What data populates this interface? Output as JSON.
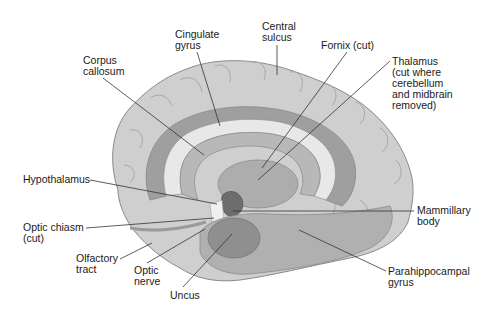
{
  "diagram": {
    "labels": [
      {
        "id": "cingulate-gyrus",
        "lines": [
          "Cingulate",
          "gyrus"
        ],
        "x": 175,
        "y": 29
      },
      {
        "id": "central-sulcus",
        "lines": [
          "Central",
          "sulcus"
        ],
        "x": 262,
        "y": 21
      },
      {
        "id": "fornix",
        "lines": [
          "Fornix (cut)"
        ],
        "x": 321,
        "y": 40
      },
      {
        "id": "corpus-callosum",
        "lines": [
          "Corpus",
          "callosum"
        ],
        "x": 83,
        "y": 55
      },
      {
        "id": "thalamus",
        "lines": [
          "Thalamus",
          "(cut where",
          "cerebellum",
          "and midbrain",
          "removed)"
        ],
        "x": 392,
        "y": 56
      },
      {
        "id": "hypothalamus",
        "lines": [
          "Hypothalamus"
        ],
        "x": 23,
        "y": 174
      },
      {
        "id": "optic-chiasm",
        "lines": [
          "Optic chiasm",
          "(cut)"
        ],
        "x": 23,
        "y": 222
      },
      {
        "id": "mammillary-body",
        "lines": [
          "Mammillary",
          "body"
        ],
        "x": 417,
        "y": 205
      },
      {
        "id": "olfactory-tract",
        "lines": [
          "Olfactory",
          "tract"
        ],
        "x": 76,
        "y": 253
      },
      {
        "id": "optic-nerve",
        "lines": [
          "Optic",
          "nerve"
        ],
        "x": 134,
        "y": 265
      },
      {
        "id": "uncus",
        "lines": [
          "Uncus"
        ],
        "x": 170,
        "y": 290
      },
      {
        "id": "parahippocampal-gyrus",
        "lines": [
          "Parahippocampal",
          "gyrus"
        ],
        "x": 388,
        "y": 266
      }
    ],
    "leader_lines": [
      {
        "id": "cingulate-gyrus",
        "x1": 197,
        "y1": 52,
        "x2": 220,
        "y2": 126
      },
      {
        "id": "central-sulcus",
        "x1": 277,
        "y1": 45,
        "x2": 277,
        "y2": 75
      },
      {
        "id": "fornix",
        "x1": 347,
        "y1": 52,
        "x2": 262,
        "y2": 168
      },
      {
        "id": "corpus-callosum",
        "x1": 103,
        "y1": 78,
        "x2": 204,
        "y2": 155
      },
      {
        "id": "thalamus",
        "x1": 390,
        "y1": 61,
        "x2": 258,
        "y2": 180
      },
      {
        "id": "hypothalamus",
        "x1": 90,
        "y1": 180,
        "x2": 217,
        "y2": 204
      },
      {
        "id": "optic-chiasm",
        "x1": 86,
        "y1": 228,
        "x2": 214,
        "y2": 218
      },
      {
        "id": "mammillary-body",
        "x1": 233,
        "y1": 211,
        "x2": 414,
        "y2": 211
      },
      {
        "id": "olfactory-tract",
        "x1": 120,
        "y1": 259,
        "x2": 152,
        "y2": 243
      },
      {
        "id": "optic-nerve",
        "x1": 147,
        "y1": 263,
        "x2": 205,
        "y2": 229
      },
      {
        "id": "uncus",
        "x1": 183,
        "y1": 287,
        "x2": 232,
        "y2": 234
      },
      {
        "id": "parahippocampal-gyrus",
        "x1": 386,
        "y1": 271,
        "x2": 299,
        "y2": 230
      }
    ],
    "colors": {
      "background": "#ffffff",
      "cortex": "#c9c9c9",
      "cortex_light": "#dcdcdc",
      "cingulate": "#9c9c9c",
      "callosum": "#e6e6e6",
      "fornix": "#b3b3b3",
      "thalamus": "#a8a8a8",
      "hypothalamus": "#6a6a6a",
      "temporal": "#a9a9a9",
      "uncus": "#8e8e8e",
      "line": "#333333",
      "text": "#1a1a1a"
    }
  }
}
